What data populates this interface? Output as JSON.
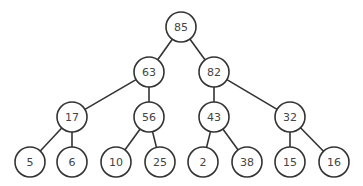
{
  "diagram": {
    "type": "binary-tree (max-heap)",
    "node_radius": 15,
    "nodes": [
      {
        "id": "n0",
        "value": "85",
        "x": 181,
        "y": 27
      },
      {
        "id": "n1",
        "value": "63",
        "x": 149,
        "y": 72
      },
      {
        "id": "n2",
        "value": "82",
        "x": 214,
        "y": 72
      },
      {
        "id": "n3",
        "value": "17",
        "x": 72,
        "y": 117
      },
      {
        "id": "n4",
        "value": "56",
        "x": 149,
        "y": 117
      },
      {
        "id": "n5",
        "value": "43",
        "x": 214,
        "y": 117
      },
      {
        "id": "n6",
        "value": "32",
        "x": 290,
        "y": 117
      },
      {
        "id": "n7",
        "value": "5",
        "x": 30,
        "y": 162
      },
      {
        "id": "n8",
        "value": "6",
        "x": 72,
        "y": 162
      },
      {
        "id": "n9",
        "value": "10",
        "x": 116,
        "y": 162
      },
      {
        "id": "n10",
        "value": "25",
        "x": 160,
        "y": 162
      },
      {
        "id": "n11",
        "value": "2",
        "x": 203,
        "y": 162
      },
      {
        "id": "n12",
        "value": "38",
        "x": 247,
        "y": 162
      },
      {
        "id": "n13",
        "value": "15",
        "x": 290,
        "y": 162
      },
      {
        "id": "n14",
        "value": "16",
        "x": 334,
        "y": 162
      }
    ],
    "edges": [
      [
        "n0",
        "n1"
      ],
      [
        "n0",
        "n2"
      ],
      [
        "n1",
        "n3"
      ],
      [
        "n1",
        "n4"
      ],
      [
        "n2",
        "n5"
      ],
      [
        "n2",
        "n6"
      ],
      [
        "n3",
        "n7"
      ],
      [
        "n3",
        "n8"
      ],
      [
        "n4",
        "n9"
      ],
      [
        "n4",
        "n10"
      ],
      [
        "n5",
        "n11"
      ],
      [
        "n5",
        "n12"
      ],
      [
        "n6",
        "n13"
      ],
      [
        "n6",
        "n14"
      ]
    ]
  }
}
